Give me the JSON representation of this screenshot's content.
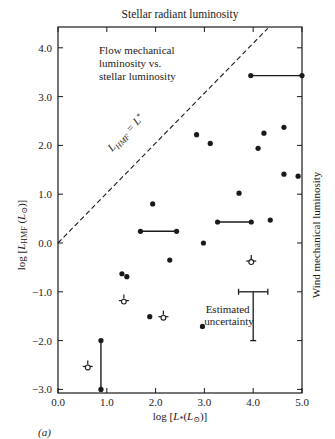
{
  "figure": {
    "top_title": "Stellar radiant luminosity",
    "right_label": "Wind mechanical luminosity",
    "panel_label": "(a)",
    "annotation_lines": [
      "Flow mechanical",
      "luminosity vs.",
      "stellar luminosity"
    ],
    "diagonal_label": "L_HMF = L*",
    "uncertainty_label_lines": [
      "Estimated",
      "uncertainty"
    ]
  },
  "chart_data": {
    "type": "scatter",
    "title": "Flow mechanical luminosity vs. stellar luminosity",
    "top_axis_label": "Stellar radiant luminosity",
    "right_axis_label": "Wind mechanical luminosity",
    "xlabel": "log [L*(L⊙)]",
    "ylabel": "log [L_HMF (L⊙)]",
    "xlim": [
      0.0,
      5.0
    ],
    "ylim": [
      -3.0,
      4.4
    ],
    "xticks": [
      "0.0",
      "1.0",
      "2.0",
      "3.0",
      "4.0",
      "5.0"
    ],
    "yticks": [
      "-3.0",
      "-2.0",
      "-1.0",
      "0.0",
      "1.0",
      "2.0",
      "3.0",
      "4.0"
    ],
    "grid": false,
    "reference_line": {
      "label": "L_HMF = L*",
      "style": "dashed",
      "x": [
        0.0,
        4.3
      ],
      "y": [
        0.0,
        4.4
      ]
    },
    "series": [
      {
        "name": "Filled points (detections)",
        "marker": "filled-circle",
        "points": [
          {
            "x": 1.94,
            "y": 0.8
          },
          {
            "x": 2.84,
            "y": 2.22
          },
          {
            "x": 3.12,
            "y": 2.04
          },
          {
            "x": 4.22,
            "y": 2.25
          },
          {
            "x": 4.1,
            "y": 1.94
          },
          {
            "x": 4.63,
            "y": 2.37
          },
          {
            "x": 4.63,
            "y": 1.41
          },
          {
            "x": 4.92,
            "y": 1.37
          },
          {
            "x": 3.71,
            "y": 1.02
          },
          {
            "x": 2.98,
            "y": 0.0
          },
          {
            "x": 2.29,
            "y": -0.35
          },
          {
            "x": 4.35,
            "y": 0.47
          },
          {
            "x": 1.31,
            "y": -0.63
          },
          {
            "x": 1.41,
            "y": -0.69
          },
          {
            "x": 1.88,
            "y": -1.51
          },
          {
            "x": 2.96,
            "y": -1.71
          }
        ]
      },
      {
        "name": "Ranges (horizontal / vertical bars)",
        "marker": "bar-with-endpoints",
        "segments": [
          {
            "x1": 3.95,
            "y1": 3.43,
            "x2": 5.0,
            "y2": 3.43
          },
          {
            "x1": 1.69,
            "y1": 0.24,
            "x2": 2.43,
            "y2": 0.24
          },
          {
            "x1": 3.27,
            "y1": 0.43,
            "x2": 3.96,
            "y2": 0.43
          },
          {
            "x1": 0.88,
            "y1": -2.0,
            "x2": 0.88,
            "y2": -3.0
          }
        ]
      },
      {
        "name": "Open points (upper limits)",
        "marker": "open-circle-with-bar",
        "points": [
          {
            "x": 3.96,
            "y": -0.37
          },
          {
            "x": 1.35,
            "y": -1.18
          },
          {
            "x": 2.16,
            "y": -1.51
          },
          {
            "x": 0.61,
            "y": -2.53
          }
        ]
      }
    ],
    "uncertainty_bar": {
      "label": "Estimated uncertainty",
      "x_center": 4.0,
      "x_range": [
        3.7,
        4.3
      ],
      "y_top": -1.0,
      "y_bottom": -2.0
    }
  }
}
